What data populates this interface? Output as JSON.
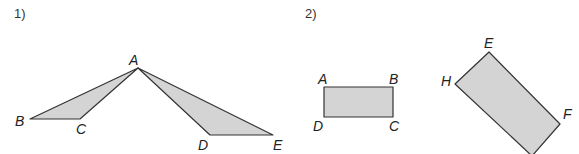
{
  "figures": [
    {
      "number": "1)",
      "description": "Two triangles sharing vertex A: triangle ABC and triangle ADE",
      "labels": {
        "A": "A",
        "B": "B",
        "C": "C",
        "D": "D",
        "E": "E"
      },
      "fill_color": "#d4d4d4",
      "stroke_color": "#333333"
    },
    {
      "number": "2)",
      "description": "Rectangle ABCD and a rotated rectangle EFGH",
      "labels": {
        "A": "A",
        "B": "B",
        "C": "C",
        "D": "D",
        "E": "E",
        "F": "F",
        "H": "H"
      },
      "fill_color": "#d4d4d4",
      "stroke_color": "#333333"
    }
  ]
}
